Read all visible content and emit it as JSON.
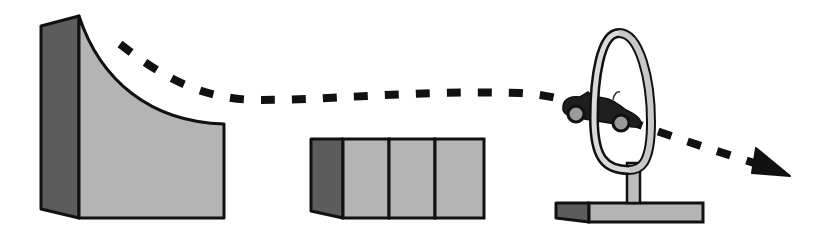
{
  "scene": {
    "description": "Toy car launched from a curved ramp, past a block, jumping through a hoop on a stand; dashed trajectory with arrow",
    "elements": [
      {
        "name": "curved-ramp",
        "role": "launch ramp"
      },
      {
        "name": "block",
        "role": "obstacle / rectangular box with three panels"
      },
      {
        "name": "hoop-stand",
        "role": "vertical ring on a post with base"
      },
      {
        "name": "toy-car",
        "role": "vehicle passing through hoop"
      },
      {
        "name": "trajectory",
        "role": "dashed path with arrowhead"
      }
    ]
  },
  "colors": {
    "background": "#ffffff",
    "outline": "#111111",
    "light_face": "#b4b4b4",
    "dark_face": "#5c5c5c",
    "ring_face": "#c8c8c8",
    "car_body": "#1e1e1e",
    "wheel": "#9a9a9a",
    "dash": "#111111"
  }
}
